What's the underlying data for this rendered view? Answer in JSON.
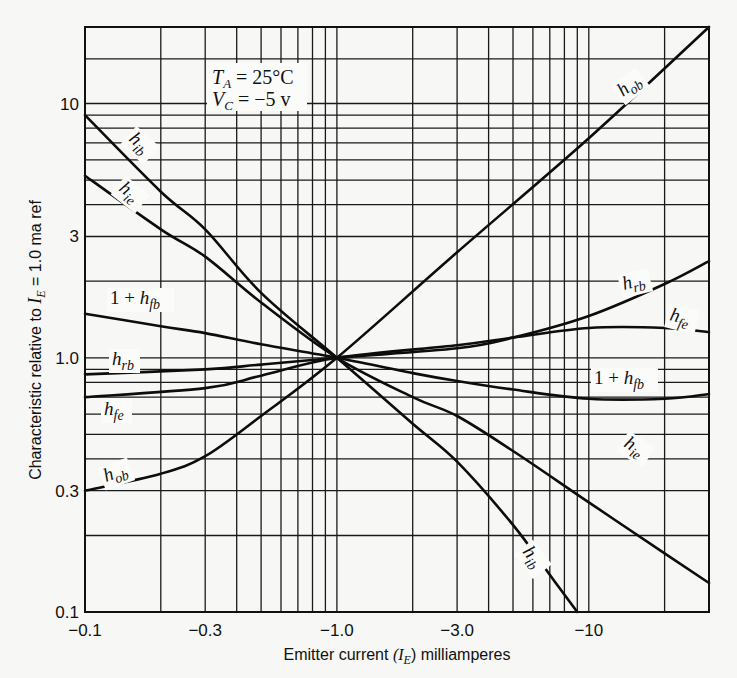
{
  "chart_data": {
    "type": "line",
    "title": "",
    "xlabel": "Emitter current (I_E) milliamperes",
    "xlabel_parts": {
      "pre": "Emitter current ",
      "var": "(I",
      "sub": "E",
      "post": ") milliamperes"
    },
    "ylabel": "Characteristic relative to I_E = 1.0 ma ref",
    "ylabel_parts": {
      "pre": "Characteristic relative to ",
      "var": "I",
      "sub": "E",
      "post": " = 1.0 ma ref"
    },
    "xscale": "log",
    "yscale": "log",
    "xlim": [
      -0.1,
      -30
    ],
    "ylim": [
      0.1,
      20
    ],
    "x_ticks": [
      {
        "value": 0.1,
        "label": "−0.1"
      },
      {
        "value": 0.3,
        "label": "−0.3"
      },
      {
        "value": 1.0,
        "label": "−1.0"
      },
      {
        "value": 3.0,
        "label": "−3.0"
      },
      {
        "value": 10,
        "label": "−10"
      }
    ],
    "y_ticks": [
      {
        "value": 0.1,
        "label": "0.1"
      },
      {
        "value": 0.3,
        "label": "0.3"
      },
      {
        "value": 1.0,
        "label": "1.0"
      },
      {
        "value": 3,
        "label": "3"
      },
      {
        "value": 10,
        "label": "10"
      }
    ],
    "x_gridlines": [
      0.1,
      0.2,
      0.3,
      0.4,
      0.5,
      0.6,
      0.7,
      0.8,
      0.9,
      1,
      2,
      3,
      4,
      5,
      6,
      7,
      8,
      9,
      10,
      20,
      30
    ],
    "y_gridlines": [
      0.1,
      0.2,
      0.3,
      0.4,
      0.5,
      0.6,
      0.7,
      0.8,
      0.9,
      1,
      2,
      3,
      4,
      5,
      6,
      7,
      8,
      9,
      10,
      15,
      20
    ],
    "grid": true,
    "annotations": [
      {
        "text_var": "T",
        "text_sub": "A",
        "text_rest": " = 25°C"
      },
      {
        "text_var": "V",
        "text_sub": "C",
        "text_rest": " = −5 v"
      }
    ],
    "series": [
      {
        "name": "h_ib",
        "label_main": "h",
        "label_sub": "ib",
        "x": [
          0.1,
          0.2,
          0.3,
          0.5,
          1.0,
          2.0,
          3.0,
          5.0,
          7.0,
          9.0
        ],
        "values": [
          9.0,
          4.5,
          3.2,
          1.8,
          1.0,
          0.55,
          0.39,
          0.22,
          0.14,
          0.1
        ]
      },
      {
        "name": "h_ie",
        "label_main": "h",
        "label_sub": "ie",
        "x": [
          0.1,
          0.2,
          0.3,
          0.5,
          1.0,
          2.0,
          3.0,
          5.0,
          10,
          20,
          30
        ],
        "values": [
          5.2,
          3.2,
          2.5,
          1.65,
          1.0,
          0.7,
          0.59,
          0.43,
          0.27,
          0.17,
          0.13
        ]
      },
      {
        "name": "1 + h_fb",
        "label_main": "1 + h",
        "label_sub": "fb",
        "x": [
          0.1,
          0.2,
          0.3,
          0.5,
          1.0,
          2.0,
          3.0,
          5.0,
          10,
          20,
          30
        ],
        "values": [
          1.49,
          1.33,
          1.25,
          1.13,
          1.0,
          0.87,
          0.81,
          0.75,
          0.69,
          0.69,
          0.72
        ]
      },
      {
        "name": "h_rb",
        "label_main": "h",
        "label_sub": "rb",
        "x": [
          0.1,
          0.3,
          0.5,
          1.0,
          3.0,
          5.0,
          10,
          20,
          30
        ],
        "values": [
          0.86,
          0.9,
          0.94,
          1.0,
          1.09,
          1.2,
          1.46,
          1.95,
          2.4
        ]
      },
      {
        "name": "h_fe",
        "label_main": "h",
        "label_sub": "fe",
        "x": [
          0.1,
          0.3,
          0.5,
          1.0,
          3.0,
          5.0,
          10,
          20,
          30
        ],
        "values": [
          0.7,
          0.76,
          0.85,
          1.0,
          1.12,
          1.2,
          1.31,
          1.31,
          1.26
        ]
      },
      {
        "name": "h_ob",
        "label_main": "h",
        "label_sub": "ob",
        "x": [
          0.1,
          0.2,
          0.3,
          0.5,
          1.0,
          3.0,
          10,
          30
        ],
        "values": [
          0.3,
          0.35,
          0.41,
          0.59,
          1.0,
          2.6,
          7.3,
          20
        ]
      }
    ]
  }
}
